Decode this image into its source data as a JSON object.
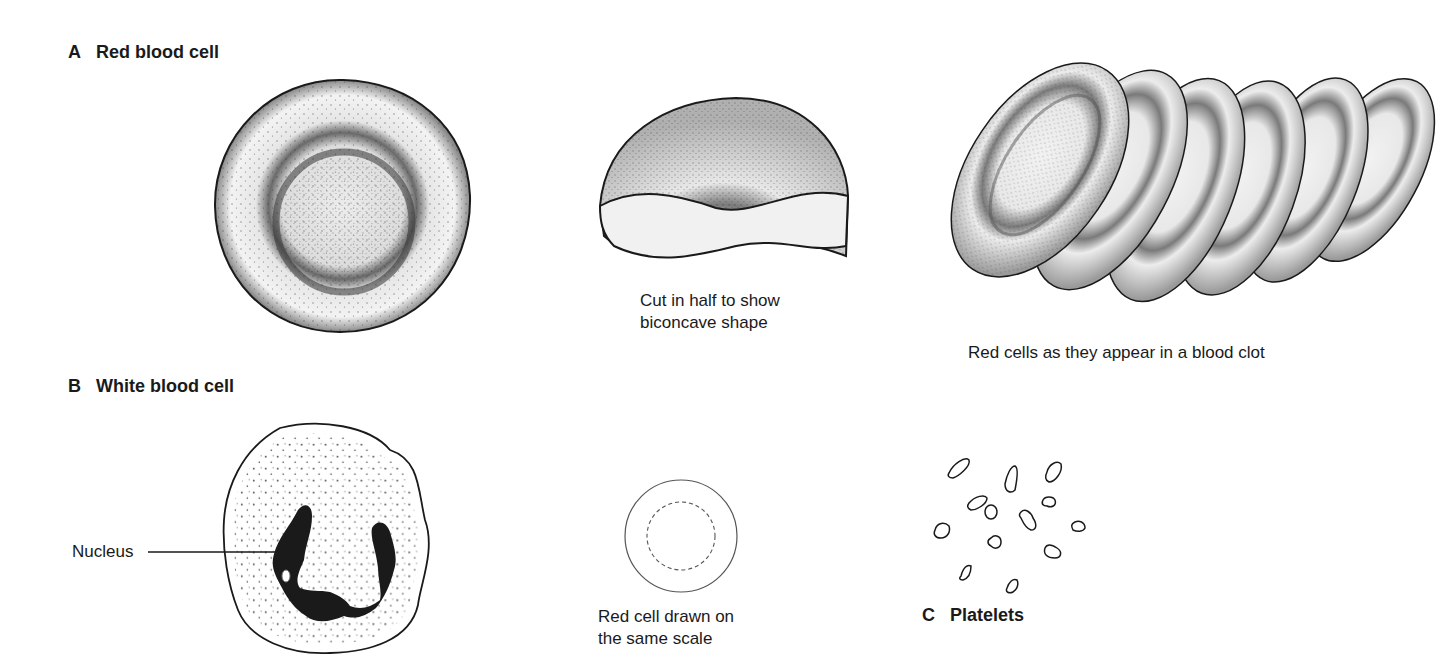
{
  "sections": {
    "a": {
      "letter": "A",
      "title": "Red blood cell"
    },
    "b": {
      "letter": "B",
      "title": "White blood cell"
    },
    "c": {
      "letter": "C",
      "title": "Platelets"
    }
  },
  "captions": {
    "cut_in_half_line1": "Cut in half to show",
    "cut_in_half_line2": "biconcave  shape",
    "blood_clot": "Red cells as they appear in a blood clot",
    "same_scale_line1": "Red cell drawn on",
    "same_scale_line2": "the same scale"
  },
  "labels": {
    "nucleus": "Nucleus"
  },
  "colors": {
    "ink": "#1a1a1a",
    "background": "#ffffff"
  }
}
